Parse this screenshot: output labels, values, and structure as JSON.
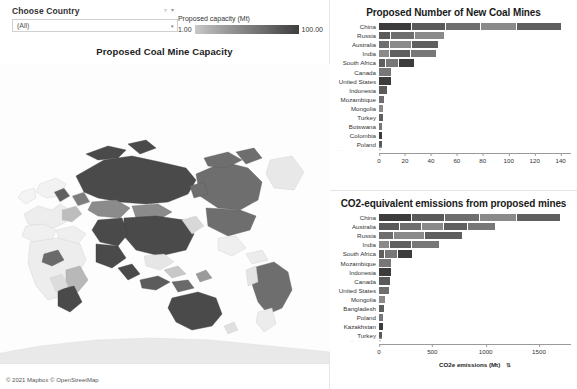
{
  "filter": {
    "label": "Choose Country",
    "value": "(All)",
    "caret": "▾"
  },
  "legend": {
    "title": "Proposed capacity (Mt)",
    "min": "1.00",
    "max": "100.00",
    "icon_filter": "▿",
    "icon_caret": "▾"
  },
  "map": {
    "title": "Proposed Coal Mine Capacity",
    "attribution": "© 2021 Mapbox © OpenStreetMap"
  },
  "chart_data": [
    {
      "type": "bar",
      "orientation": "horizontal",
      "title": "Proposed Number of New Coal Mines",
      "xlabel": "",
      "ylabel": "",
      "xlim": [
        0,
        148
      ],
      "ticks": [
        0,
        20,
        40,
        60,
        80,
        100,
        120,
        140
      ],
      "grid": false,
      "categories": [
        "China",
        "Russia",
        "Australia",
        "India",
        "South Africa",
        "Canada",
        "United States",
        "Indonesia",
        "Mozambique",
        "Mongolia",
        "Turkey",
        "Botswana",
        "Colombia",
        "Poland",
        "United States"
      ],
      "values": [
        141,
        51,
        46,
        45,
        28,
        10,
        10,
        7,
        5,
        4,
        4,
        3,
        3,
        3,
        2
      ]
    },
    {
      "type": "bar",
      "orientation": "horizontal",
      "title": "CO2-equivalent emissions from proposed mines",
      "xlabel": "CO2e emissions (Mt)",
      "ylabel": "",
      "xlim": [
        0,
        1800
      ],
      "ticks": [
        0,
        500,
        1000,
        1500
      ],
      "grid": false,
      "sort_icon": "⇅",
      "categories": [
        "China",
        "Australia",
        "Russia",
        "India",
        "South Africa",
        "Mozambique",
        "Indonesia",
        "Canada",
        "United States",
        "Mongolia",
        "Bangladesh",
        "Poland",
        "Kazakhstan",
        "Turkey",
        "Colombia"
      ],
      "values": [
        1710,
        1100,
        790,
        570,
        320,
        120,
        120,
        110,
        105,
        70,
        55,
        50,
        45,
        40,
        30
      ]
    }
  ],
  "colors": {
    "bar_dark": "#4a4a4a",
    "bar_mid": "#6e6e6e",
    "bar_light": "#9c9c9c",
    "map_high": "#4a4a4a",
    "map_low": "#d8d8d8",
    "background": "#ffffff"
  }
}
